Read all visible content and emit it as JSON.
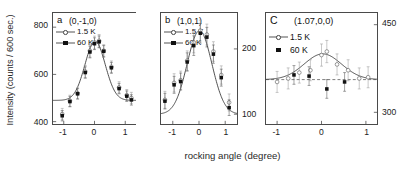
{
  "figure": {
    "xlabel": "rocking angle (degree)",
    "ylabel": "Intensity (counts / 600 sec.)"
  },
  "legend_common": {
    "series1": "1.5 K",
    "series2": "60 K"
  },
  "panels": {
    "a": {
      "letter": "a",
      "title": "(0,-1,0)",
      "yticks": [
        "400",
        "600",
        "800"
      ],
      "xticks": [
        "-1",
        "0",
        "1"
      ]
    },
    "b": {
      "letter": "b",
      "title": "(1,0,1)",
      "yticks": [
        "100",
        "200"
      ],
      "xticks": [
        "-1",
        "0",
        "1"
      ]
    },
    "c": {
      "letter": "C",
      "title": "(1.07,0,0)",
      "yticks": [
        "300",
        "450"
      ],
      "xticks": [
        "-1",
        "0",
        "1"
      ]
    }
  },
  "chart_data": [
    {
      "type": "scatter",
      "panel": "a",
      "title": "(0,-1,0)",
      "xlabel": "rocking angle (degree)",
      "ylabel": "Intensity (counts / 600 sec.)",
      "xlim": [
        -1.35,
        1.35
      ],
      "ylim": [
        390,
        860
      ],
      "xticks": [
        -1,
        0,
        1
      ],
      "yticks": [
        400,
        600,
        800
      ],
      "grid": false,
      "legend_position": "top-left",
      "series": [
        {
          "name": "1.5 K",
          "marker": "open-circle",
          "line": "solid-fit",
          "x": [
            -1.05,
            -0.8,
            -0.55,
            -0.3,
            -0.15,
            0.0,
            0.15,
            0.3,
            0.55,
            0.8,
            1.05,
            1.2
          ],
          "values": [
            432,
            488,
            520,
            612,
            700,
            735,
            742,
            700,
            632,
            545,
            512,
            500
          ],
          "errors": [
            24,
            24,
            24,
            26,
            27,
            27,
            27,
            26,
            25,
            24,
            24,
            24
          ]
        },
        {
          "name": "60 K",
          "marker": "filled-square",
          "x": [
            -1.05,
            -0.8,
            -0.55,
            -0.3,
            -0.15,
            0.0,
            0.15,
            0.3,
            0.55,
            0.8,
            1.05,
            1.2
          ],
          "values": [
            425,
            485,
            518,
            608,
            695,
            730,
            738,
            698,
            628,
            540,
            508,
            492
          ],
          "errors": [
            22,
            22,
            22,
            24,
            25,
            25,
            25,
            24,
            23,
            22,
            22,
            22
          ]
        }
      ],
      "fit_curve": {
        "shape": "gaussian",
        "baseline": 490,
        "amplitude": 250,
        "center": 0.02,
        "sigma": 0.33
      }
    },
    {
      "type": "scatter",
      "panel": "b",
      "title": "(1,0,1)",
      "xlabel": "rocking angle (degree)",
      "ylabel": "Intensity (counts / 600 sec.)",
      "xlim": [
        -1.45,
        1.45
      ],
      "ylim": [
        85,
        255
      ],
      "xticks": [
        -1,
        0,
        1
      ],
      "yticks": [
        100,
        200
      ],
      "grid": false,
      "legend_position": "top-left",
      "series": [
        {
          "name": "1.5 K",
          "marker": "open-circle",
          "line": "solid-fit",
          "x": [
            -1.3,
            -0.95,
            -0.7,
            -0.45,
            -0.2,
            0.05,
            0.3,
            0.55,
            0.85,
            1.15
          ],
          "values": [
            122,
            148,
            152,
            182,
            210,
            228,
            222,
            196,
            160,
            118
          ],
          "errors": [
            13,
            14,
            14,
            15,
            16,
            16,
            16,
            15,
            14,
            13
          ]
        },
        {
          "name": "60 K",
          "marker": "filled-square",
          "x": [
            -1.3,
            -0.95,
            -0.7,
            -0.45,
            -0.2,
            0.05,
            0.3,
            0.55,
            0.85,
            1.15
          ],
          "values": [
            120,
            145,
            150,
            180,
            205,
            224,
            218,
            192,
            156,
            110
          ],
          "errors": [
            12,
            13,
            13,
            14,
            15,
            15,
            15,
            14,
            13,
            12
          ]
        }
      ],
      "fit_curve": {
        "shape": "gaussian",
        "baseline": 100,
        "amplitude": 128,
        "center": 0.02,
        "sigma": 0.47
      }
    },
    {
      "type": "scatter",
      "panel": "c",
      "title": "(1.07,0,0)",
      "xlabel": "rocking angle (degree)",
      "ylabel": "Intensity (counts / 600 sec.)",
      "xlim": [
        -1.25,
        1.25
      ],
      "ylim": [
        280,
        470
      ],
      "xticks": [
        -1,
        0,
        1
      ],
      "yticks": [
        300,
        450
      ],
      "grid": false,
      "legend_position": "top-left",
      "series": [
        {
          "name": "1.5 K",
          "marker": "open-circle",
          "line": "solid-fit",
          "x": [
            -1.0,
            -0.75,
            -0.5,
            -0.25,
            0.0,
            0.12,
            0.35,
            0.6,
            0.85,
            1.05
          ],
          "values": [
            352,
            358,
            368,
            372,
            398,
            404,
            382,
            372,
            358,
            360
          ],
          "errors": [
            18,
            18,
            18,
            18,
            19,
            19,
            18,
            18,
            18,
            18
          ]
        },
        {
          "name": "60 K",
          "marker": "filled-square",
          "x": [
            -0.62,
            -0.28,
            0.12,
            0.52
          ],
          "values": [
            364,
            362,
            340,
            352
          ],
          "errors": [
            16,
            16,
            16,
            16
          ]
        }
      ],
      "fit_curve": {
        "shape": "gaussian",
        "baseline": 356,
        "amplitude": 44,
        "center": 0.03,
        "sigma": 0.42
      },
      "baseline_curve": {
        "shape": "dashed-horizontal",
        "value": 356
      }
    }
  ]
}
